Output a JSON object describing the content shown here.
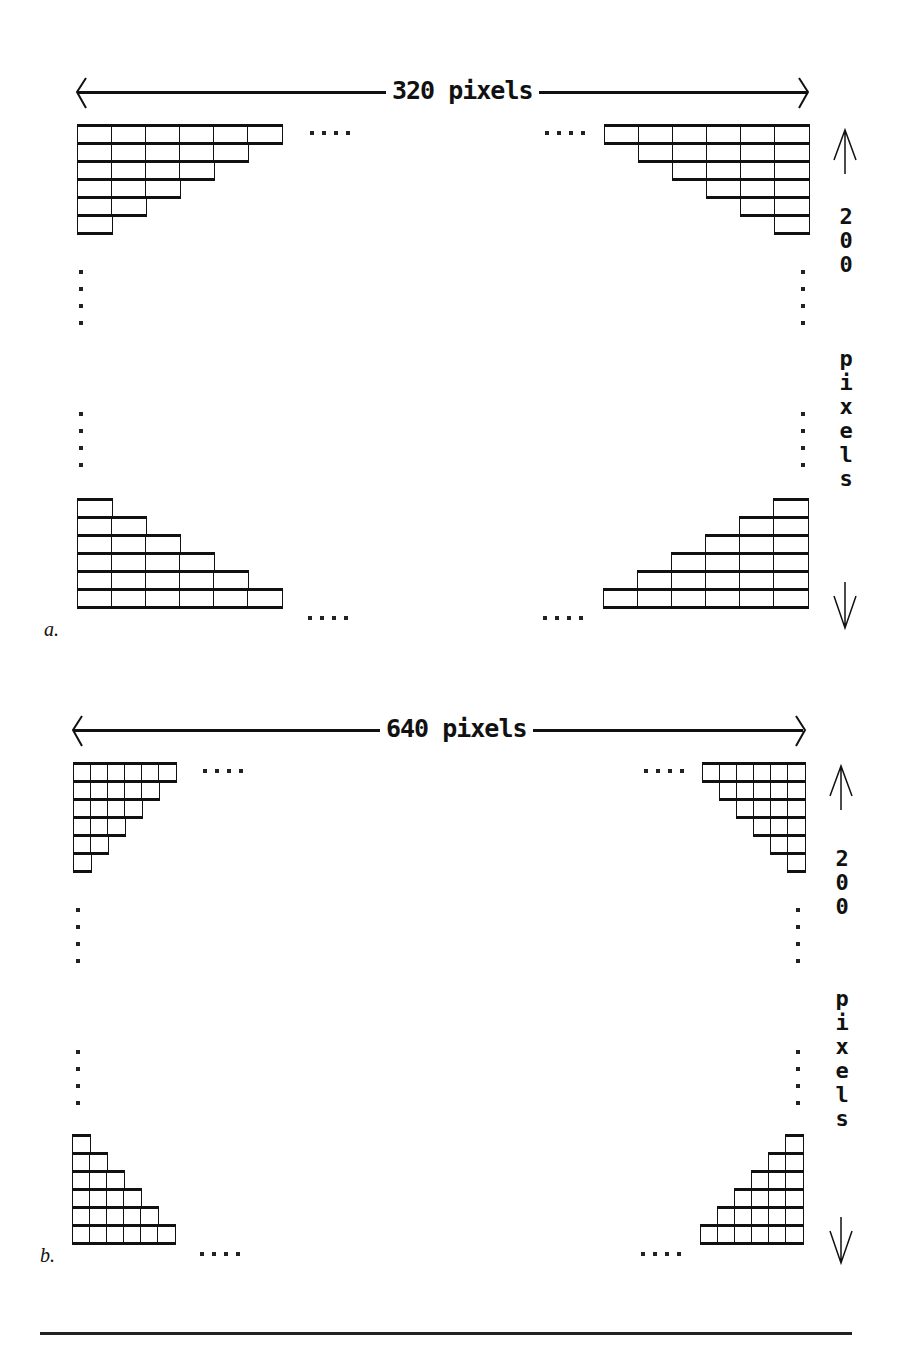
{
  "panels": [
    {
      "id": "a",
      "tag": "a.",
      "width_label": "320 pixels",
      "height_label_number": [
        "2",
        "0",
        "0"
      ],
      "height_label_word": [
        "p",
        "i",
        "x",
        "e",
        "l",
        "s"
      ],
      "cell_size": {
        "w": 34,
        "h": 18
      },
      "rows": 6,
      "ellipsis": "····"
    },
    {
      "id": "b",
      "tag": "b.",
      "width_label": "640 pixels",
      "height_label_number": [
        "2",
        "0",
        "0"
      ],
      "height_label_word": [
        "p",
        "i",
        "x",
        "e",
        "l",
        "s"
      ],
      "cell_size": {
        "w": 17,
        "h": 18
      },
      "rows": 6,
      "ellipsis": "····"
    }
  ],
  "colors": {
    "ink": "#111111",
    "paper": "#ffffff"
  }
}
